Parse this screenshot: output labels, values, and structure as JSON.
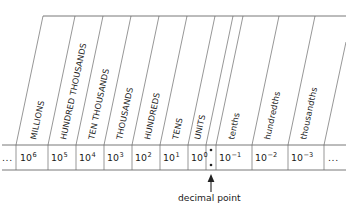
{
  "diagram": {
    "columns": [
      {
        "id": "left-ellipsis",
        "name": "",
        "power": "...",
        "base": "",
        "exponent": "",
        "kind": "ellipsis"
      },
      {
        "id": "millions",
        "name": "MILLIONS",
        "base": "10",
        "exponent": "6",
        "kind": "whole"
      },
      {
        "id": "hundred-thousands",
        "name": "HUNDRED THOUSANDS",
        "base": "10",
        "exponent": "5",
        "kind": "whole"
      },
      {
        "id": "ten-thousands",
        "name": "TEN THOUSANDS",
        "base": "10",
        "exponent": "4",
        "kind": "whole"
      },
      {
        "id": "thousands",
        "name": "THOUSANDS",
        "base": "10",
        "exponent": "3",
        "kind": "whole"
      },
      {
        "id": "hundreds",
        "name": "HUNDREDS",
        "base": "10",
        "exponent": "2",
        "kind": "whole"
      },
      {
        "id": "tens",
        "name": "TENS",
        "base": "10",
        "exponent": "1",
        "kind": "whole"
      },
      {
        "id": "units",
        "name": "UNITS",
        "base": "10",
        "exponent": "0",
        "kind": "whole"
      },
      {
        "id": "decimal-point",
        "name": "",
        "base": "",
        "exponent": "",
        "kind": "point"
      },
      {
        "id": "tenths",
        "name": "tenths",
        "base": "10",
        "exponent": "−1",
        "kind": "fraction"
      },
      {
        "id": "hundredths",
        "name": "hundredths",
        "base": "10",
        "exponent": "−2",
        "kind": "fraction"
      },
      {
        "id": "thousandths",
        "name": "thousandths",
        "base": "10",
        "exponent": "−3",
        "kind": "fraction"
      },
      {
        "id": "right-ellipsis",
        "name": "",
        "power": "...",
        "base": "",
        "exponent": "",
        "kind": "ellipsis"
      }
    ],
    "annotation": {
      "label": "decimal point",
      "points_to": "decimal-point"
    },
    "colors": {
      "rule": "#555555",
      "text": "#1a1a1a",
      "arrow": "#222222",
      "background": "#ffffff"
    }
  }
}
